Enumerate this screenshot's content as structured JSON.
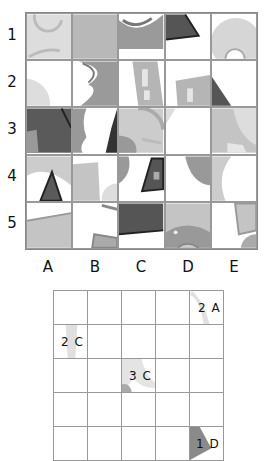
{
  "puzzle": {
    "row_labels": [
      "1",
      "2",
      "3",
      "4",
      "5"
    ],
    "col_labels": [
      "A",
      "B",
      "C",
      "D",
      "E"
    ]
  },
  "answer_grid": {
    "rows": 5,
    "cols": 5,
    "hints": [
      {
        "row": 1,
        "col": 5,
        "label": "2 A"
      },
      {
        "row": 2,
        "col": 1,
        "label": "2 C"
      },
      {
        "row": 3,
        "col": 3,
        "label": "3 C"
      },
      {
        "row": 5,
        "col": 5,
        "label": "1 D"
      }
    ]
  },
  "colors": {
    "light_gray": "#d4d4d4",
    "mid_gray": "#a9a9a9",
    "dark_gray": "#5a5a5a",
    "grid_line": "#999999"
  }
}
